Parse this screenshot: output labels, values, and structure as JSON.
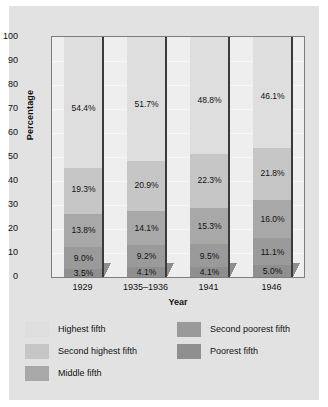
{
  "chart_data": {
    "type": "bar",
    "stacked": true,
    "title": "",
    "xlabel": "Year",
    "ylabel": "Percentage",
    "ylim": [
      0,
      100
    ],
    "yticks": [
      0,
      10,
      20,
      30,
      40,
      50,
      60,
      70,
      80,
      90,
      100
    ],
    "ytick_labels": [
      "0",
      "10",
      "20",
      "30",
      "40",
      "50",
      "60",
      "70",
      "80",
      "90",
      "100"
    ],
    "grid": true,
    "legend_position": "bottom",
    "categories": [
      "1929",
      "1935–1936",
      "1941",
      "1946"
    ],
    "series": [
      {
        "name": "Poorest fifth",
        "color": "#8f8f8f",
        "values": [
          3.5,
          4.1,
          4.1,
          5.0
        ],
        "labels": [
          "3.5%",
          "4.1%",
          "4.1%",
          "5.0%"
        ]
      },
      {
        "name": "Second poorest fifth",
        "color": "#9a9a9a",
        "values": [
          9.0,
          9.2,
          9.5,
          11.1
        ],
        "labels": [
          "9.0%",
          "9.2%",
          "9.5%",
          "11.1%"
        ]
      },
      {
        "name": "Middle fifth",
        "color": "#a8a8a8",
        "values": [
          13.8,
          14.1,
          15.3,
          16.0
        ],
        "labels": [
          "13.8%",
          "14.1%",
          "15.3%",
          "16.0%"
        ]
      },
      {
        "name": "Second highest fifth",
        "color": "#c6c6c6",
        "values": [
          19.3,
          20.9,
          22.3,
          21.8
        ],
        "labels": [
          "19.3%",
          "20.9%",
          "22.3%",
          "21.8%"
        ]
      },
      {
        "name": "Highest fifth",
        "color": "#dedede",
        "values": [
          54.4,
          51.7,
          48.8,
          46.1
        ],
        "labels": [
          "54.4%",
          "51.7%",
          "48.8%",
          "46.1%"
        ]
      }
    ]
  },
  "legend": {
    "left_column": [
      {
        "label": "Highest fifth",
        "color": "#dedede"
      },
      {
        "label": "Second highest fifth",
        "color": "#c6c6c6"
      },
      {
        "label": "Middle fifth",
        "color": "#a8a8a8"
      }
    ],
    "right_column": [
      {
        "label": "Second poorest fifth",
        "color": "#9a9a9a"
      },
      {
        "label": "Poorest fifth",
        "color": "#8f8f8f"
      }
    ]
  },
  "figure": {
    "background_color": "#e2e2e2",
    "plot_background_color": "#eeeeee",
    "frame_color": "#7d7d7d"
  }
}
